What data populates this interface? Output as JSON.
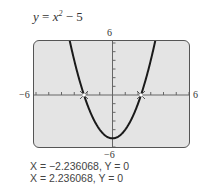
{
  "equation": {
    "lhs": "y",
    "eq": " = ",
    "base": "x",
    "exp": "2",
    "rest": " − 5"
  },
  "window": {
    "xmin": "−6",
    "xmax": "6",
    "ymin": "−6",
    "ymax": "6"
  },
  "results": [
    "X = −2.236068, Y = 0",
    "X = 2.236068, Y = 0"
  ],
  "colors": {
    "screen_bg": "#e4e4e4",
    "curve": "#1a1a1a"
  },
  "chart_data": {
    "type": "line",
    "function": "x^2 - 5",
    "xlim": [
      -6,
      6
    ],
    "ylim": [
      -6,
      6
    ],
    "xlabel": "",
    "ylabel": "",
    "tick_spacing": 1,
    "grid": false,
    "zeros": [
      {
        "x": -2.236068,
        "y": 0
      },
      {
        "x": 2.236068,
        "y": 0
      }
    ],
    "vertex": {
      "x": 0,
      "y": -5
    },
    "sample_points": [
      {
        "x": -3.3,
        "y": 5.89
      },
      {
        "x": -3,
        "y": 4
      },
      {
        "x": -2.236068,
        "y": 0
      },
      {
        "x": -2,
        "y": -1
      },
      {
        "x": -1,
        "y": -4
      },
      {
        "x": 0,
        "y": -5
      },
      {
        "x": 1,
        "y": -4
      },
      {
        "x": 2,
        "y": -1
      },
      {
        "x": 2.236068,
        "y": 0
      },
      {
        "x": 3,
        "y": 4
      },
      {
        "x": 3.3,
        "y": 5.89
      }
    ]
  }
}
